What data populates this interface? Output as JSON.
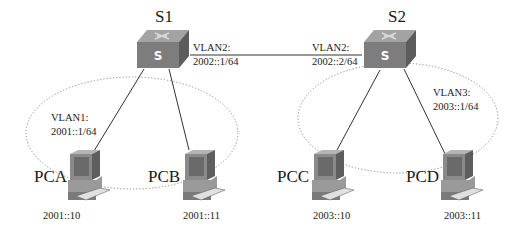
{
  "diagram": {
    "switches": [
      {
        "id": "S1",
        "label": "S1",
        "vlan_link_label": "VLAN2:",
        "vlan_link_addr": "2002::1/64"
      },
      {
        "id": "S2",
        "label": "S2",
        "vlan_link_label": "VLAN2:",
        "vlan_link_addr": "2002::2/64"
      }
    ],
    "vlan_groups": [
      {
        "switch": "S1",
        "vlan_label": "VLAN1:",
        "vlan_addr": "2001::1/64"
      },
      {
        "switch": "S2",
        "vlan_label": "VLAN3:",
        "vlan_addr": "2003::1/64"
      }
    ],
    "hosts": [
      {
        "label": "PCA",
        "addr": "2001::10",
        "switch": "S1"
      },
      {
        "label": "PCB",
        "addr": "2001::11",
        "switch": "S1"
      },
      {
        "label": "PCC",
        "addr": "2003::10",
        "switch": "S2"
      },
      {
        "label": "PCD",
        "addr": "2003::11",
        "switch": "S2"
      }
    ],
    "colors": {
      "switch_top": "#9a9a9a",
      "switch_front": "#7a7a7a",
      "switch_side": "#5e5e5e",
      "pc_body": "#8c8c8c",
      "line": "#333333",
      "ellipse": "#888888"
    }
  }
}
